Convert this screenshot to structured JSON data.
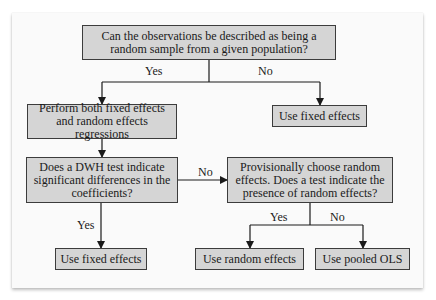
{
  "diagram": {
    "type": "flowchart",
    "nodes": {
      "q_random_sample": "Can the observations be described as being a random sample from a given population?",
      "perform_both": "Perform both fixed effects and random effects regressions",
      "use_fixed_effects_top": "Use fixed effects",
      "q_dwh": "Does a DWH test indicate significant differences in the coefficients?",
      "q_provisional": "Provisionally choose random effects. Does a test indicate the presence of random effects?",
      "use_fixed_effects_bottom": "Use fixed effects",
      "use_random_effects": "Use random effects",
      "use_pooled_ols": "Use pooled OLS"
    },
    "edge_labels": {
      "random_sample_yes": "Yes",
      "random_sample_no": "No",
      "dwh_no": "No",
      "dwh_yes": "Yes",
      "provisional_yes": "Yes",
      "provisional_no": "No"
    },
    "edges": [
      {
        "from": "q_random_sample",
        "to": "perform_both",
        "label": "Yes"
      },
      {
        "from": "q_random_sample",
        "to": "use_fixed_effects_top",
        "label": "No"
      },
      {
        "from": "perform_both",
        "to": "q_dwh",
        "label": ""
      },
      {
        "from": "q_dwh",
        "to": "q_provisional",
        "label": "No"
      },
      {
        "from": "q_dwh",
        "to": "use_fixed_effects_bottom",
        "label": "Yes"
      },
      {
        "from": "q_provisional",
        "to": "use_random_effects",
        "label": "Yes"
      },
      {
        "from": "q_provisional",
        "to": "use_pooled_ols",
        "label": "No"
      }
    ],
    "colors": {
      "box_fill": "#d5d5d5",
      "box_border": "#3c3c3c",
      "line": "#1a1a1a",
      "panel": "#fafafa"
    }
  }
}
